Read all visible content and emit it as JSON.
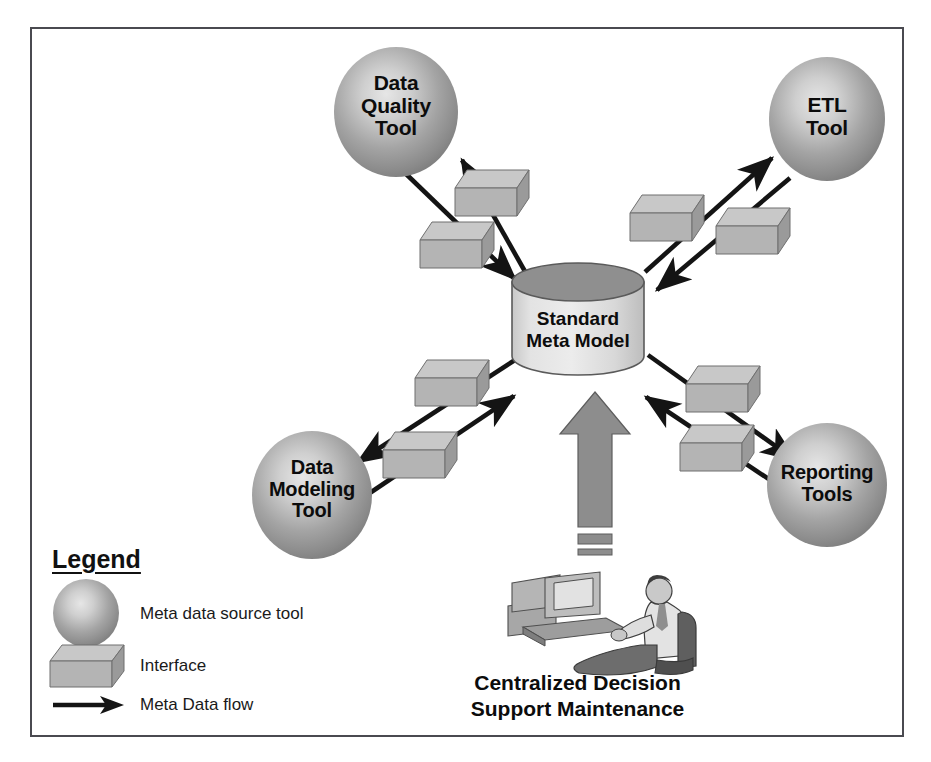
{
  "figure": {
    "background_color": "#ffffff",
    "frame_color": "#4a4a50"
  },
  "center": {
    "shape": "cylinder",
    "label_line1": "Standard",
    "label_line2": "Meta Model",
    "top_fill": "#8f8f8f",
    "body_fill": "#dcdcdc"
  },
  "nodes": [
    {
      "id": "data-quality-tool",
      "lines": [
        "Data",
        "Quality",
        "Tool"
      ],
      "shape": "sphere",
      "position": "top-left"
    },
    {
      "id": "etl-tool",
      "lines": [
        "ETL",
        "Tool"
      ],
      "shape": "sphere",
      "position": "top-right"
    },
    {
      "id": "data-modeling-tool",
      "lines": [
        "Data",
        "Modeling",
        "Tool"
      ],
      "shape": "sphere",
      "position": "bottom-left"
    },
    {
      "id": "reporting-tools",
      "lines": [
        "Reporting",
        "Tools"
      ],
      "shape": "sphere",
      "position": "bottom-right"
    }
  ],
  "actor": {
    "caption_line1": "Centralized Decision",
    "caption_line2": "Support Maintenance",
    "icon": "person-at-computer-icon"
  },
  "legend": {
    "title": "Legend",
    "items": [
      {
        "symbol": "sphere-icon",
        "label": "Meta data source tool"
      },
      {
        "symbol": "cube-icon",
        "label": "Interface"
      },
      {
        "symbol": "arrow-icon",
        "label": "Meta Data flow"
      }
    ]
  },
  "colors": {
    "sphere_light": "#d6d6d6",
    "sphere_mid": "#9a9a9a",
    "sphere_dark": "#6e6e6e",
    "cube_top": "#c3c3c3",
    "cube_front": "#b0b0b0",
    "cube_side": "#8a8a8a",
    "arrow_black": "#141414",
    "arrow_gray": "#8d8d8d",
    "text": "#0c0c0c"
  },
  "flows": [
    {
      "from": "standard-meta-model",
      "to": "data-quality-tool",
      "interfaces": 1
    },
    {
      "from": "data-quality-tool",
      "to": "standard-meta-model",
      "interfaces": 1
    },
    {
      "from": "standard-meta-model",
      "to": "etl-tool",
      "interfaces": 1
    },
    {
      "from": "etl-tool",
      "to": "standard-meta-model",
      "interfaces": 1
    },
    {
      "from": "standard-meta-model",
      "to": "data-modeling-tool",
      "interfaces": 1
    },
    {
      "from": "data-modeling-tool",
      "to": "standard-meta-model",
      "interfaces": 1
    },
    {
      "from": "standard-meta-model",
      "to": "reporting-tools",
      "interfaces": 1
    },
    {
      "from": "reporting-tools",
      "to": "standard-meta-model",
      "interfaces": 1
    },
    {
      "from": "centralized-decision-support-maintenance",
      "to": "standard-meta-model",
      "interfaces": 0
    }
  ]
}
